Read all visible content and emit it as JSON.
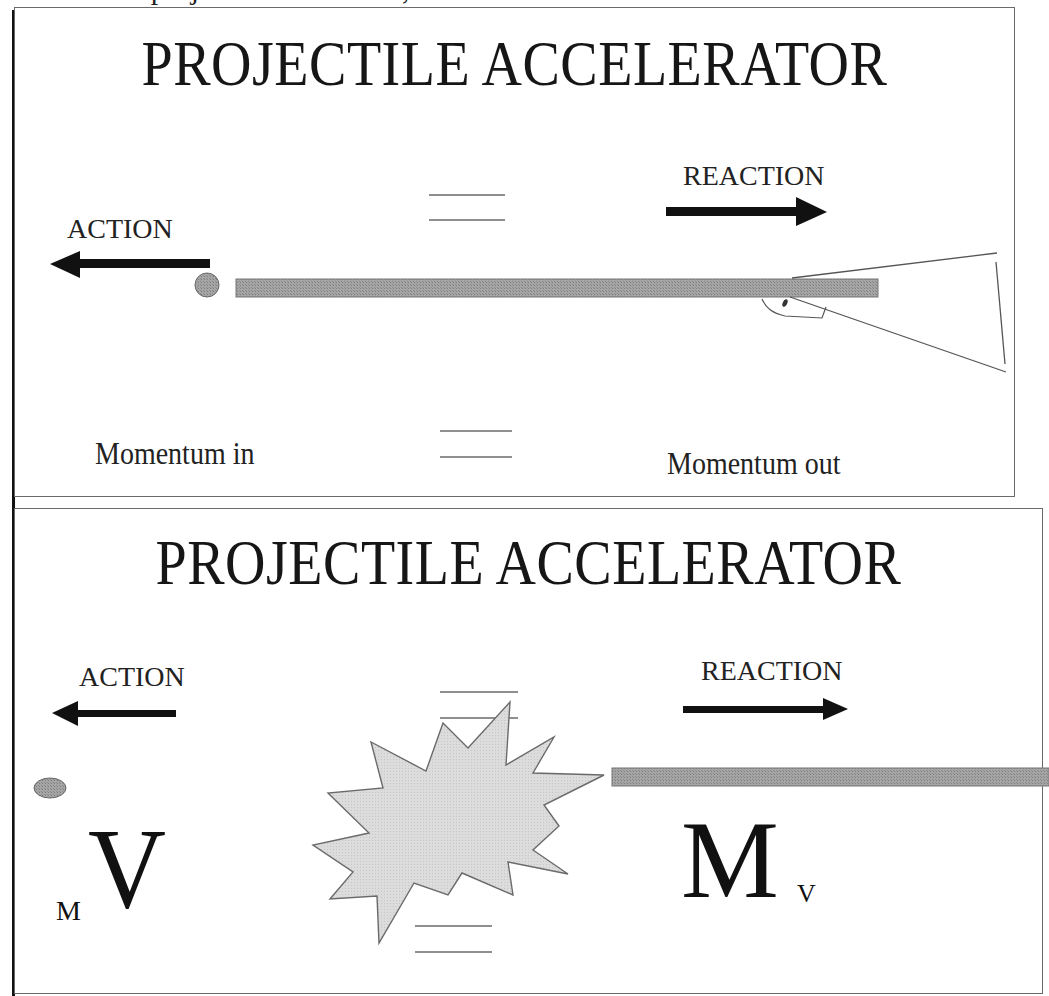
{
  "cut_off_header": "a projectile accelerator, .",
  "colors": {
    "barrel_fill": "#9a9a9a",
    "projectile_fill": "#999999",
    "boom_fill": "#d9d9d9",
    "arrow_fill": "#111111",
    "border": "#6a6a6a"
  },
  "panels": [
    {
      "title": "PROJECTILE ACCELERATOR",
      "action_label": "ACTION",
      "reaction_label": "REACTION",
      "momentum_in_label": "Momentum in",
      "momentum_out_label": "Momentum out",
      "equals_symbols": [
        "equals-upper",
        "equals-lower"
      ],
      "projectile_shape": "circle",
      "device": "rifle"
    },
    {
      "title": "PROJECTILE ACCELERATOR",
      "action_label": "ACTION",
      "reaction_label": "REACTION",
      "boom_label": "BOOM",
      "left_expression": {
        "small": "M",
        "large": "V"
      },
      "right_expression": {
        "large": "M",
        "small": "V"
      },
      "projectile_shape": "ellipse",
      "device": "barrel"
    }
  ]
}
